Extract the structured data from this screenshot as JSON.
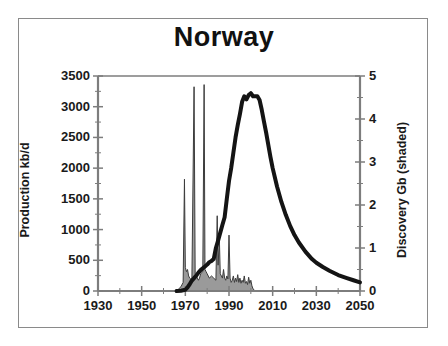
{
  "figure": {
    "title": "Norway",
    "background_color": "#ffffff",
    "frame_color": "#8a8a8a"
  },
  "chart_data": {
    "type": "line",
    "title": "Norway",
    "xlabel": "",
    "ylabel": "Production kb/d",
    "y2label": "Discovery Gb (shaded)",
    "xlim": [
      1930,
      2050
    ],
    "ylim": [
      0,
      3500
    ],
    "y2lim": [
      0,
      5
    ],
    "grid": false,
    "legend": null,
    "xticks": [
      1930,
      1950,
      1970,
      1990,
      2010,
      2030,
      2050
    ],
    "xtick_labels": [
      "1930",
      "1950",
      "1970",
      "1990",
      "2010",
      "2030",
      "2050"
    ],
    "xminor_step": 10,
    "yticks": [
      0,
      500,
      1000,
      1500,
      2000,
      2500,
      3000,
      3500
    ],
    "ytick_labels": [
      "0",
      "500",
      "1000",
      "1500",
      "2000",
      "2500",
      "3000",
      "3500"
    ],
    "yminor_step": 250,
    "y2ticks": [
      0,
      1,
      2,
      3,
      4,
      5
    ],
    "y2tick_labels": [
      "0",
      "1",
      "2",
      "3",
      "4",
      "5"
    ],
    "y2minor_step": 0.5,
    "series": [
      {
        "name": "Production kb/d",
        "type": "line",
        "axis": "left",
        "color": "#141414",
        "line_width": 4,
        "x": [
          1966,
          1968,
          1970,
          1971,
          1972,
          1973,
          1974,
          1975,
          1976,
          1977,
          1978,
          1979,
          1980,
          1981,
          1982,
          1983,
          1984,
          1985,
          1986,
          1987,
          1988,
          1989,
          1990,
          1991,
          1992,
          1993,
          1994,
          1995,
          1996,
          1997,
          1998,
          1999,
          2000,
          2001,
          2002,
          2003,
          2004,
          2005,
          2006,
          2007,
          2008,
          2009,
          2010,
          2012,
          2014,
          2016,
          2018,
          2020,
          2022,
          2025,
          2028,
          2030,
          2033,
          2036,
          2040,
          2044,
          2047,
          2050
        ],
        "y": [
          0,
          5,
          20,
          60,
          110,
          170,
          210,
          250,
          300,
          340,
          370,
          400,
          430,
          470,
          490,
          520,
          700,
          820,
          950,
          1080,
          1200,
          1500,
          1790,
          2000,
          2250,
          2500,
          2700,
          2880,
          3080,
          3170,
          3120,
          3190,
          3220,
          3170,
          3170,
          3170,
          3110,
          2950,
          2760,
          2580,
          2380,
          2180,
          2000,
          1700,
          1450,
          1240,
          1060,
          910,
          790,
          640,
          520,
          460,
          390,
          330,
          260,
          210,
          175,
          140
        ]
      },
      {
        "name": "Discovery Gb (shaded)",
        "type": "area",
        "axis": "right",
        "fill_color": "#9a9a9a",
        "edge_color": "#3c3c3c",
        "x": [
          1966,
          1967,
          1968,
          1969,
          1969.6,
          1970,
          1970.5,
          1971,
          1971.5,
          1972,
          1973,
          1974,
          1974.5,
          1975,
          1975.5,
          1976,
          1976.5,
          1977,
          1978,
          1978.6,
          1979,
          1979.5,
          1980,
          1981,
          1982,
          1983,
          1984,
          1984.6,
          1985,
          1985.6,
          1986,
          1987,
          1987.5,
          1988,
          1988.5,
          1989,
          1989.5,
          1990,
          1990.5,
          1991,
          1991.5,
          1992,
          1992.5,
          1993,
          1993.5,
          1994,
          1994.5,
          1995,
          1995.5,
          1996,
          1996.5,
          1997,
          1997.5,
          1998,
          1998.5,
          1999,
          1999.5,
          2000,
          2000.5,
          2001,
          2002
        ],
        "y": [
          0,
          0.05,
          0.1,
          0.2,
          2.6,
          0.55,
          0.45,
          0.5,
          0.35,
          0.3,
          0.25,
          4.75,
          0.4,
          0.35,
          0.3,
          0.25,
          0.3,
          0.4,
          0.45,
          4.8,
          0.5,
          0.45,
          0.4,
          0.3,
          0.35,
          0.3,
          0.25,
          1.75,
          0.6,
          1.2,
          0.4,
          0.3,
          0.5,
          0.3,
          0.25,
          0.35,
          0.28,
          1.3,
          0.3,
          0.2,
          0.25,
          0.35,
          0.2,
          0.3,
          0.22,
          0.38,
          0.2,
          0.3,
          0.18,
          0.25,
          0.2,
          0.35,
          0.18,
          0.22,
          0.15,
          0.32,
          0.18,
          0.25,
          0.12,
          0.05,
          0
        ]
      }
    ]
  },
  "axes": {
    "left_title": "Production kb/d",
    "right_title": "Discovery Gb (shaded)"
  }
}
